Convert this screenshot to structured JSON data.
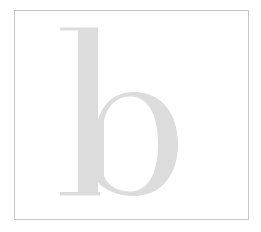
{
  "figure": {
    "letter": "b",
    "colors": {
      "background": "#ffffff",
      "frame": "#c6c6c6",
      "letter": "#dcdcdc"
    }
  }
}
